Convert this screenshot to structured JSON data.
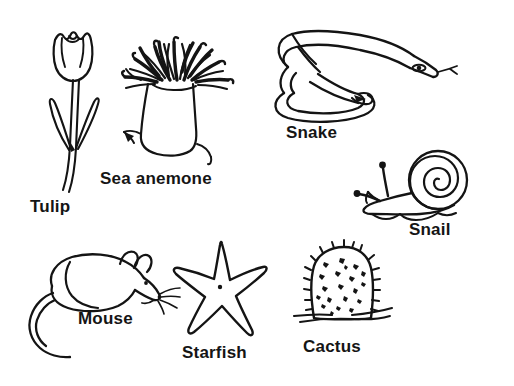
{
  "sheet": {
    "title": "Labeled line drawings of organisms",
    "background_color": "#ffffff",
    "ink_color": "#141414",
    "width": 514,
    "height": 386
  },
  "figures": [
    {
      "id": "tulip",
      "icon": "tulip-flower-icon",
      "label": "Tulip",
      "label_x": 30,
      "label_y": 198,
      "kind": "plant"
    },
    {
      "id": "sea-anemone",
      "icon": "sea-anemone-icon",
      "label": "Sea anemone",
      "label_x": 100,
      "label_y": 170,
      "kind": "animal"
    },
    {
      "id": "snake",
      "icon": "snake-icon",
      "label": "Snake",
      "label_x": 286,
      "label_y": 124,
      "kind": "animal"
    },
    {
      "id": "snail",
      "icon": "snail-icon",
      "label": "Snail",
      "label_x": 409,
      "label_y": 221,
      "kind": "animal"
    },
    {
      "id": "mouse",
      "icon": "mouse-icon",
      "label": "Mouse",
      "label_x": 78,
      "label_y": 310,
      "kind": "animal"
    },
    {
      "id": "starfish",
      "icon": "starfish-icon",
      "label": "Starfish",
      "label_x": 182,
      "label_y": 344,
      "kind": "animal"
    },
    {
      "id": "cactus",
      "icon": "cactus-icon",
      "label": "Cactus",
      "label_x": 303,
      "label_y": 338,
      "kind": "plant"
    }
  ]
}
